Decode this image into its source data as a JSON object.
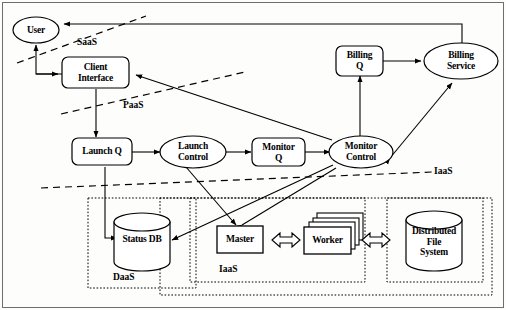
{
  "diagram": {
    "nodes": {
      "user": "User",
      "client_interface": "Client\nInterface",
      "billing_q": "Billing\nQ",
      "billing_service": "Billing\nService",
      "launch_q": "Launch Q",
      "launch_control": "Launch\nControl",
      "monitor_q": "Monitor\nQ",
      "monitor_control": "Monitor\nControl",
      "status_db": "Status DB",
      "master": "Master",
      "worker": "Worker",
      "distributed_file_system": "Distributed\nFile\nSystem"
    },
    "zones": {
      "saas": "SaaS",
      "paas": "PaaS",
      "iaas_boundary": "IaaS",
      "daas": "DaaS",
      "iaas_group": "IaaS"
    },
    "colors": {
      "stroke": "#000000",
      "fill": "#ffffff",
      "background": "#fdfdfc",
      "dashed": "#000000"
    },
    "edges": [
      {
        "from": "billing_service",
        "to": "user",
        "style": "solid-orthogonal"
      },
      {
        "from": "user",
        "to": "client_interface",
        "style": "solid-orthogonal"
      },
      {
        "from": "client_interface",
        "to": "user",
        "style": "solid-orthogonal"
      },
      {
        "from": "client_interface",
        "to": "launch_q",
        "style": "solid"
      },
      {
        "from": "monitor_control",
        "to": "client_interface",
        "style": "solid"
      },
      {
        "from": "launch_q",
        "to": "launch_control",
        "style": "solid"
      },
      {
        "from": "launch_control",
        "to": "monitor_q",
        "style": "solid"
      },
      {
        "from": "monitor_q",
        "to": "monitor_control",
        "style": "solid"
      },
      {
        "from": "monitor_control",
        "to": "billing_q",
        "style": "solid"
      },
      {
        "from": "billing_q",
        "to": "billing_service",
        "style": "solid"
      },
      {
        "from": "monitor_control",
        "to": "billing_service",
        "style": "double"
      },
      {
        "from": "launch_q",
        "to": "status_db",
        "style": "solid-orthogonal"
      },
      {
        "from": "monitor_control",
        "to": "status_db",
        "style": "solid"
      },
      {
        "from": "launch_control",
        "to": "master",
        "style": "solid"
      },
      {
        "from": "master",
        "to": "monitor_control",
        "style": "solid"
      },
      {
        "from": "master",
        "to": "worker",
        "style": "double"
      },
      {
        "from": "worker",
        "to": "distributed_file_system",
        "style": "double"
      }
    ]
  }
}
